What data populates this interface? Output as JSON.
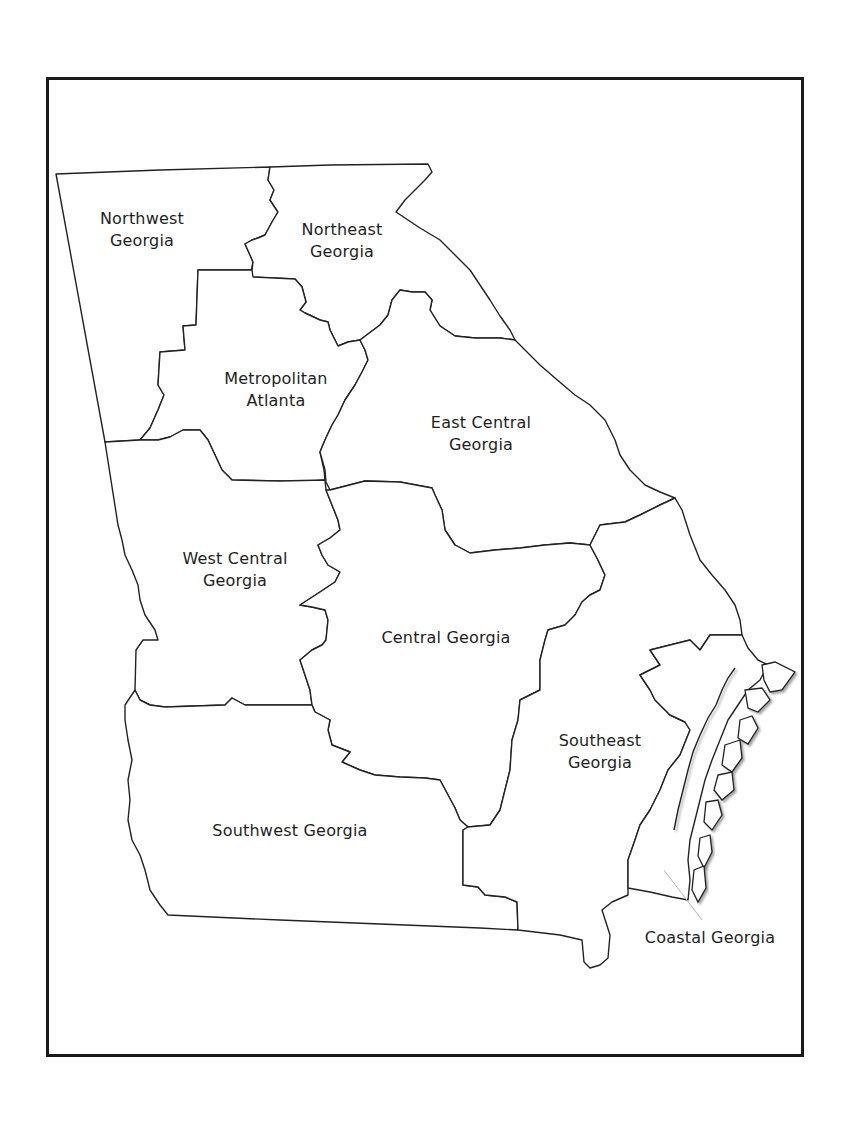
{
  "map": {
    "title": "Georgia Regions",
    "border_color": "#1a1a1a",
    "line_color": "#222222",
    "fill_color": "#ffffff",
    "regions": [
      {
        "id": "northwest",
        "label": "Northwest\nGeorgia"
      },
      {
        "id": "northeast",
        "label": "Northeast\nGeorgia"
      },
      {
        "id": "metro",
        "label": "Metropolitan\nAtlanta"
      },
      {
        "id": "east-central",
        "label": "East Central\nGeorgia"
      },
      {
        "id": "west-central",
        "label": "West Central\nGeorgia"
      },
      {
        "id": "central",
        "label": "Central Georgia"
      },
      {
        "id": "southeast",
        "label": "Southeast\nGeorgia"
      },
      {
        "id": "southwest",
        "label": "Southwest Georgia"
      },
      {
        "id": "coastal",
        "label": "Coastal Georgia"
      }
    ]
  }
}
